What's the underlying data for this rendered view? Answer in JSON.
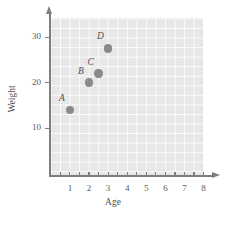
{
  "chart_data": {
    "type": "scatter",
    "title": "",
    "xlabel": "Age",
    "ylabel": "Weight",
    "xlim": [
      0,
      8.1
    ],
    "ylim": [
      0,
      33
    ],
    "grid": true,
    "grid_step_x": 0.5,
    "grid_step_y": 2,
    "legend": "none",
    "x_ticks": [
      1,
      2,
      3,
      4,
      5,
      6,
      7,
      8
    ],
    "x_tick_labels": [
      "1",
      "2",
      "3",
      "4",
      "5",
      "6",
      "7",
      "8"
    ],
    "x_minor_ticks": [
      0.5,
      1.5,
      2.5,
      3.5,
      4.5,
      5.5,
      6.5,
      7.5
    ],
    "y_ticks": [
      10,
      20,
      30
    ],
    "y_tick_labels": [
      "10",
      "20",
      "30"
    ],
    "point_color": "#8a8a8a",
    "plot_background": "#e7e7e7",
    "gridline_color": "#fbfbfb",
    "axis_color": "#7d7d7d",
    "points": [
      {
        "label": "A",
        "x": 1,
        "y": 14
      },
      {
        "label": "B",
        "x": 2,
        "y": 20
      },
      {
        "label": "C",
        "x": 2.5,
        "y": 22
      },
      {
        "label": "D",
        "x": 3,
        "y": 27.5
      }
    ]
  }
}
